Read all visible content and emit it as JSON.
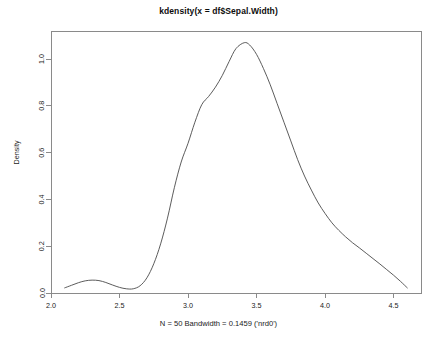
{
  "chart_data": {
    "type": "line",
    "title": "kdensity(x = df$Sepal.Width)",
    "subtitle": "N = 50   Bandwidth = 0.1459 ('nrd0')",
    "xlabel": "",
    "ylabel": "Density",
    "xlim": [
      2.0,
      4.7
    ],
    "ylim": [
      0.0,
      1.12
    ],
    "grid": false,
    "legend": false,
    "xticks": [
      "2.0",
      "2.5",
      "3.0",
      "3.5",
      "4.0",
      "4.5"
    ],
    "xtick_values": [
      2.0,
      2.5,
      3.0,
      3.5,
      4.0,
      4.5
    ],
    "yticks": [
      "0.0",
      "0.2",
      "0.4",
      "0.6",
      "0.8",
      "1.0"
    ],
    "ytick_values": [
      0.0,
      0.2,
      0.4,
      0.6,
      0.8,
      1.0
    ],
    "series": [
      {
        "name": "Sepal.Width density",
        "color": "#4a4a4a",
        "x": [
          2.1,
          2.15,
          2.2,
          2.25,
          2.3,
          2.35,
          2.4,
          2.45,
          2.5,
          2.55,
          2.6,
          2.65,
          2.7,
          2.75,
          2.8,
          2.85,
          2.9,
          2.95,
          3.0,
          3.05,
          3.1,
          3.15,
          3.2,
          3.25,
          3.3,
          3.35,
          3.41,
          3.45,
          3.5,
          3.55,
          3.6,
          3.65,
          3.7,
          3.75,
          3.8,
          3.85,
          3.9,
          3.95,
          4.0,
          4.05,
          4.1,
          4.15,
          4.2,
          4.25,
          4.3,
          4.35,
          4.4,
          4.45,
          4.5,
          4.55,
          4.6
        ],
        "y": [
          0.022,
          0.033,
          0.044,
          0.052,
          0.055,
          0.053,
          0.045,
          0.034,
          0.024,
          0.018,
          0.018,
          0.031,
          0.065,
          0.125,
          0.21,
          0.32,
          0.45,
          0.56,
          0.64,
          0.73,
          0.805,
          0.84,
          0.88,
          0.93,
          0.99,
          1.045,
          1.07,
          1.06,
          1.02,
          0.96,
          0.89,
          0.81,
          0.73,
          0.65,
          0.57,
          0.5,
          0.44,
          0.385,
          0.34,
          0.3,
          0.268,
          0.24,
          0.215,
          0.193,
          0.17,
          0.147,
          0.124,
          0.1,
          0.076,
          0.05,
          0.022
        ]
      }
    ],
    "annotations": {
      "mode_x": 3.41,
      "mode_y": 1.07,
      "secondary_bump_x": 2.3,
      "secondary_bump_y": 0.055,
      "local_min_x": 2.56,
      "local_min_y": 0.018
    }
  }
}
